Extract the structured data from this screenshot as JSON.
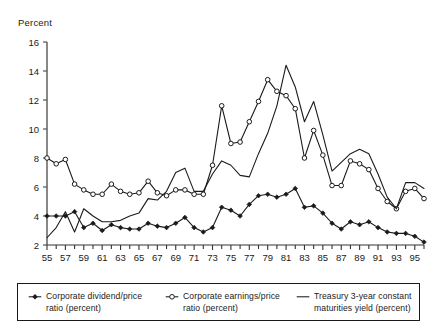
{
  "axis_unit_label": "Percent",
  "legend": {
    "items": [
      {
        "marker": "filled-diamond-line-icon",
        "label": "Corporate dividend/price\nratio (percent)"
      },
      {
        "marker": "open-circle-line-icon",
        "label": "Corporate earnings/price\nratio (percent)"
      },
      {
        "marker": "plain-line-icon",
        "label": "Treasury 3-year constant\nmaturities yield (percent)"
      }
    ]
  },
  "chart_data": {
    "type": "line",
    "title": "",
    "subtitle": "",
    "xlabel": "",
    "ylabel": "Percent",
    "grid": false,
    "legend_position": "bottom",
    "xlim": [
      1955,
      1996
    ],
    "ylim": [
      2,
      16
    ],
    "yticks": [
      2,
      4,
      6,
      8,
      10,
      12,
      14,
      16
    ],
    "ytick_labels": [
      "2",
      "4",
      "6",
      "8",
      "10",
      "12",
      "14",
      "16"
    ],
    "x": [
      1955,
      1956,
      1957,
      1958,
      1959,
      1960,
      1961,
      1962,
      1963,
      1964,
      1965,
      1966,
      1967,
      1968,
      1969,
      1970,
      1971,
      1972,
      1973,
      1974,
      1975,
      1976,
      1977,
      1978,
      1979,
      1980,
      1981,
      1982,
      1983,
      1984,
      1985,
      1986,
      1987,
      1988,
      1989,
      1990,
      1991,
      1992,
      1993,
      1994,
      1995,
      1996
    ],
    "xtick_labels": [
      "55",
      "",
      "57",
      "",
      "59",
      "",
      "61",
      "",
      "63",
      "",
      "65",
      "",
      "67",
      "",
      "69",
      "",
      "71",
      "",
      "73",
      "",
      "75",
      "",
      "77",
      "",
      "79",
      "",
      "81",
      "",
      "83",
      "",
      "85",
      "",
      "87",
      "",
      "89",
      "",
      "91",
      "",
      "93",
      "",
      "95",
      ""
    ],
    "xticks_labeled": [
      1955,
      1957,
      1959,
      1961,
      1963,
      1965,
      1967,
      1969,
      1971,
      1973,
      1975,
      1977,
      1979,
      1981,
      1983,
      1985,
      1987,
      1989,
      1991,
      1993,
      1995
    ],
    "series": [
      {
        "name": "Corporate dividend/price ratio (percent)",
        "marker": "filled-diamond",
        "color": "#1a1a1a",
        "values": [
          4.0,
          4.0,
          4.0,
          4.3,
          3.2,
          3.5,
          3.0,
          3.4,
          3.2,
          3.1,
          3.1,
          3.5,
          3.3,
          3.2,
          3.5,
          3.9,
          3.2,
          2.9,
          3.2,
          4.6,
          4.4,
          4.0,
          4.8,
          5.4,
          5.5,
          5.3,
          5.5,
          5.9,
          4.6,
          4.7,
          4.2,
          3.5,
          3.1,
          3.6,
          3.4,
          3.6,
          3.2,
          2.9,
          2.8,
          2.8,
          2.6,
          2.2
        ]
      },
      {
        "name": "Corporate earnings/price ratio (percent)",
        "marker": "open-circle",
        "color": "#1a1a1a",
        "values": [
          8.0,
          7.6,
          7.9,
          6.2,
          5.8,
          5.5,
          5.5,
          6.2,
          5.7,
          5.5,
          5.6,
          6.4,
          5.6,
          5.4,
          5.8,
          5.8,
          5.5,
          5.5,
          7.5,
          11.6,
          9.0,
          9.1,
          10.5,
          11.9,
          13.4,
          12.6,
          12.3,
          11.4,
          8.0,
          9.9,
          8.2,
          6.1,
          6.1,
          7.8,
          7.6,
          7.2,
          5.9,
          5.0,
          4.5,
          5.7,
          5.9,
          5.2
        ]
      },
      {
        "name": "Treasury 3-year constant maturities yield (percent)",
        "marker": "none",
        "color": "#1a1a1a",
        "values": [
          2.5,
          3.2,
          4.3,
          2.9,
          4.5,
          4.0,
          3.6,
          3.6,
          3.7,
          4.0,
          4.2,
          5.2,
          5.1,
          5.7,
          7.0,
          7.3,
          5.7,
          5.7,
          6.9,
          7.8,
          7.5,
          6.8,
          6.7,
          8.3,
          9.7,
          11.6,
          14.4,
          12.9,
          10.5,
          11.9,
          9.6,
          7.1,
          7.7,
          8.3,
          8.6,
          8.3,
          6.9,
          5.3,
          4.5,
          6.3,
          6.3,
          5.9
        ]
      }
    ]
  }
}
